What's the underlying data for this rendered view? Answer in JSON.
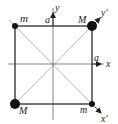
{
  "diagram": {
    "type": "square-lattice-cell",
    "atoms": [
      {
        "id": "top-left",
        "label": "m",
        "size": "small"
      },
      {
        "id": "top-right",
        "label": "M",
        "size": "large"
      },
      {
        "id": "bottom-left",
        "label": "M",
        "size": "large"
      },
      {
        "id": "bottom-right",
        "label": "m",
        "size": "small"
      }
    ],
    "axes": {
      "x": {
        "label": "x",
        "vector_label": "a"
      },
      "y": {
        "label": "y",
        "vector_label": "a"
      },
      "x_prime": {
        "label": "x′"
      },
      "y_prime": {
        "label": "y′"
      }
    },
    "colors": {
      "frame": "#3a3a3a",
      "axis": "#555555",
      "diagonal": "#aaaaaa",
      "atom": "#111111",
      "text": "#222222"
    }
  }
}
